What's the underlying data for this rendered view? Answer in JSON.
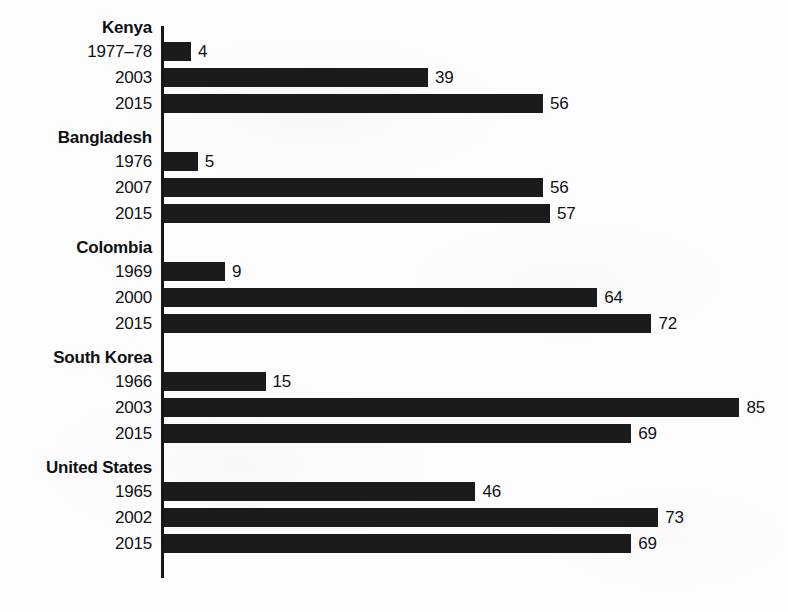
{
  "chart_data": {
    "type": "bar",
    "orientation": "horizontal",
    "title": "",
    "subtitle": "",
    "xlabel": "",
    "ylabel": "",
    "xlim": [
      0,
      85
    ],
    "grid": false,
    "legend": null,
    "value_labels": true,
    "bar_color": "#1b1b1e",
    "background_color": "#ffffff",
    "axis_color": "#17171a",
    "groups": [
      {
        "name": "Kenya",
        "categories": [
          "1977–78",
          "2003",
          "2015"
        ],
        "values": [
          4,
          39,
          56
        ]
      },
      {
        "name": "Bangladesh",
        "categories": [
          "1976",
          "2007",
          "2015"
        ],
        "values": [
          5,
          56,
          57
        ]
      },
      {
        "name": "Colombia",
        "categories": [
          "1969",
          "2000",
          "2015"
        ],
        "values": [
          9,
          64,
          72
        ]
      },
      {
        "name": "South Korea",
        "categories": [
          "1966",
          "2003",
          "2015"
        ],
        "values": [
          15,
          85,
          69
        ]
      },
      {
        "name": "United States",
        "categories": [
          "1965",
          "2002",
          "2015"
        ],
        "values": [
          46,
          73,
          69
        ]
      }
    ],
    "categories": [
      "Kenya 1977–78",
      "Kenya 2003",
      "Kenya 2015",
      "Bangladesh 1976",
      "Bangladesh 2007",
      "Bangladesh 2015",
      "Colombia 1969",
      "Colombia 2000",
      "Colombia 2015",
      "South Korea 1966",
      "South Korea 2003",
      "South Korea 2015",
      "United States 1965",
      "United States 2002",
      "United States 2015"
    ],
    "values": [
      4,
      39,
      56,
      5,
      56,
      57,
      9,
      64,
      72,
      15,
      85,
      69,
      46,
      73,
      69
    ]
  },
  "layout": {
    "axis_x": 161,
    "axis_top": 26,
    "axis_height": 552,
    "bar_left": 164,
    "bar_height": 19,
    "row_pitch": 26,
    "group_title_height": 24,
    "group_gap": 8,
    "px_per_unit": 6.77,
    "first_group_top": 18,
    "value_gap": 7
  }
}
